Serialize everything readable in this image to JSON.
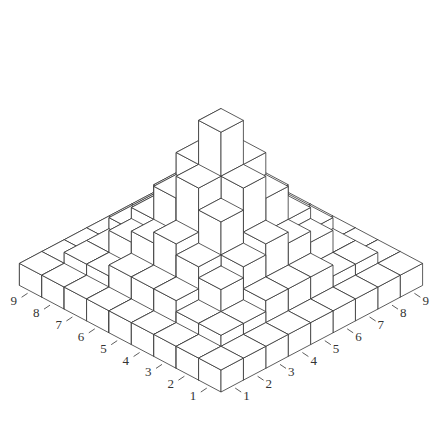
{
  "chart_data": {
    "type": "bar3d",
    "title": "",
    "x_axis_label_ticks": [
      "1",
      "2",
      "3",
      "4",
      "5",
      "6",
      "7",
      "8",
      "9"
    ],
    "y_axis_label_ticks": [
      "1",
      "2",
      "3",
      "4",
      "5",
      "6",
      "7",
      "8",
      "9"
    ],
    "grid_size": 9,
    "base_height": 1,
    "heights": [
      [
        1,
        1,
        1,
        1,
        1,
        1,
        1,
        1,
        1
      ],
      [
        1,
        2,
        2,
        3,
        3,
        3,
        2,
        2,
        1
      ],
      [
        1,
        2,
        4,
        5,
        6,
        5,
        4,
        2,
        1
      ],
      [
        1,
        3,
        5,
        8,
        10,
        8,
        5,
        3,
        1
      ],
      [
        1,
        3,
        6,
        10,
        14,
        10,
        6,
        3,
        1
      ],
      [
        1,
        3,
        5,
        8,
        10,
        8,
        5,
        3,
        1
      ],
      [
        1,
        2,
        4,
        5,
        6,
        5,
        4,
        2,
        1
      ],
      [
        1,
        2,
        2,
        3,
        3,
        3,
        2,
        2,
        1
      ],
      [
        1,
        1,
        1,
        1,
        1,
        1,
        1,
        1,
        1
      ]
    ],
    "colors": {
      "face": "#ffffff",
      "edge": "#333333"
    },
    "geometry": {
      "front_x": 221,
      "front_y": 392,
      "half_w": 22.4,
      "half_h": 11.85,
      "unit_h": 11.0
    }
  }
}
